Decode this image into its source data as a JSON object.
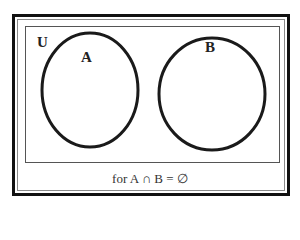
{
  "diagram": {
    "type": "venn",
    "universe_label": "U",
    "sets": [
      {
        "label": "A",
        "cx": 90,
        "cy": 90,
        "rx": 48,
        "ry": 57
      },
      {
        "label": "B",
        "cx": 212,
        "cy": 94,
        "rx": 53,
        "ry": 56
      }
    ],
    "caption": "for A ∩ B = ∅",
    "colors": {
      "stroke": "#1a1a1a",
      "frame": "#111111",
      "background": "#ffffff"
    }
  }
}
